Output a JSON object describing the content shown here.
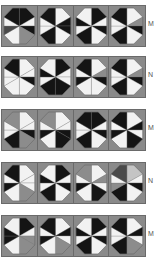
{
  "palette": {
    "K": "#141414",
    "W": "#f2f2f2",
    "G": "#8c8c8c",
    "D": "#4a4a4a",
    "L": "#c4c4c4",
    "corner": "#8a8a8a"
  },
  "wedge_order": [
    "NNE",
    "ENE",
    "ESE",
    "SSE",
    "SSW",
    "WSW",
    "WNW",
    "NNW"
  ],
  "rows": [
    {
      "label": "M",
      "top": 6,
      "tiles": [
        [
          "K",
          "W",
          "K",
          "G",
          "W",
          "D",
          "W",
          "K"
        ],
        [
          "W",
          "K",
          "K",
          "W",
          "K",
          "W",
          "W",
          "K"
        ],
        [
          "K",
          "W",
          "K",
          "W",
          "K",
          "W",
          "K",
          "W"
        ],
        [
          "W",
          "G",
          "K",
          "W",
          "K",
          "W",
          "W",
          "K"
        ]
      ]
    },
    {
      "label": "N",
      "top": 57,
      "tiles": [
        [
          "W",
          "W",
          "K",
          "W",
          "W",
          "W",
          "W",
          "K"
        ],
        [
          "K",
          "W",
          "W",
          "K",
          "K",
          "W",
          "K",
          "W"
        ],
        [
          "W",
          "G",
          "K",
          "W",
          "W",
          "K",
          "W",
          "K"
        ],
        [
          "W",
          "G",
          "K",
          "W",
          "K",
          "W",
          "W",
          "K"
        ]
      ]
    },
    {
      "label": "M",
      "top": 110,
      "tiles": [
        [
          "W",
          "W",
          "K",
          "G",
          "K",
          "W",
          "W",
          "G"
        ],
        [
          "W",
          "W",
          "K",
          "K",
          "W",
          "K",
          "W",
          "G"
        ],
        [
          "K",
          "W",
          "K",
          "W",
          "K",
          "W",
          "W",
          "K"
        ],
        [
          "W",
          "K",
          "W",
          "K",
          "W",
          "K",
          "W",
          "K"
        ]
      ]
    },
    {
      "label": "N",
      "top": 163,
      "tiles": [
        [
          "W",
          "W",
          "W",
          "G",
          "W",
          "K",
          "W",
          "K"
        ],
        [
          "K",
          "W",
          "K",
          "W",
          "K",
          "W",
          "K",
          "W"
        ],
        [
          "W",
          "G",
          "W",
          "K",
          "W",
          "K",
          "W",
          "G"
        ],
        [
          "L",
          "W",
          "K",
          "W",
          "K",
          "G",
          "W",
          "D"
        ]
      ]
    },
    {
      "label": "M",
      "top": 216,
      "tiles": [
        [
          "K",
          "W",
          "G",
          "G",
          "W",
          "K",
          "K",
          "W"
        ],
        [
          "W",
          "K",
          "W",
          "G",
          "W",
          "K",
          "W",
          "K"
        ],
        [
          "K",
          "W",
          "K",
          "W",
          "K",
          "W",
          "K",
          "W"
        ],
        [
          "W",
          "K",
          "W",
          "G",
          "K",
          "W",
          "W",
          "K"
        ]
      ]
    }
  ]
}
